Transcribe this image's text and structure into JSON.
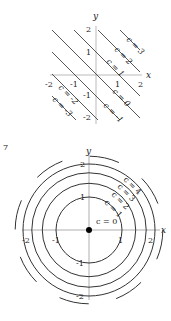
{
  "figure_top": {
    "title": "",
    "axis_x_label": "x",
    "axis_y_label": "y",
    "x_ticks": [
      "-2",
      "-1",
      "1",
      "2"
    ],
    "y_ticks": [
      "2",
      "1",
      "-1",
      "-2"
    ],
    "curve_labels": [
      "c = 3",
      "c = 2",
      "c = 1",
      "c = 0",
      "c = -1",
      "c = -2",
      "c = -3"
    ],
    "curve_values": [
      3,
      2,
      1,
      0,
      -1,
      -2,
      -3
    ]
  },
  "figure_bottom": {
    "figure_number": "7",
    "axis_x_label": "x",
    "axis_y_label": "y",
    "x_ticks": [
      "-2",
      "-1",
      "1",
      "2"
    ],
    "y_ticks": [
      "2",
      "1",
      "-1",
      "-2"
    ],
    "curve_labels": [
      "c = 0",
      "c = 1",
      "c = 2",
      "c = 3",
      "c = 4"
    ],
    "curve_values": [
      0,
      1,
      2,
      3,
      4
    ]
  },
  "colors": {
    "line": "#333333",
    "axis": "#999999"
  }
}
